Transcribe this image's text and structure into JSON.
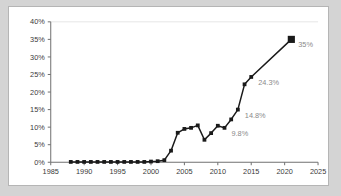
{
  "chart_data": {
    "type": "line",
    "title": "",
    "subtitle": "",
    "xlabel": "",
    "ylabel": "",
    "xlim": [
      1985,
      2025
    ],
    "ylim": [
      0,
      40
    ],
    "grid": false,
    "legend": null,
    "x_ticks": [
      "1985",
      "1990",
      "1995",
      "2000",
      "2005",
      "2010",
      "2015",
      "2020",
      "2025"
    ],
    "x_tick_values": [
      1985,
      1990,
      1995,
      2000,
      2005,
      2010,
      2015,
      2020,
      2025
    ],
    "y_ticks": [
      "0%",
      "5%",
      "10%",
      "15%",
      "20%",
      "25%",
      "30%",
      "35%",
      "40%"
    ],
    "y_tick_values": [
      0,
      5,
      10,
      15,
      20,
      25,
      30,
      35,
      40
    ],
    "series": [
      {
        "name": "",
        "x": [
          1988,
          1989,
          1990,
          1991,
          1992,
          1993,
          1994,
          1995,
          1996,
          1997,
          1998,
          1999,
          2000,
          2001,
          2002,
          2003,
          2004,
          2005,
          2006,
          2007,
          2008,
          2009,
          2010,
          2011,
          2012,
          2013,
          2014,
          2015,
          2021
        ],
        "values": [
          0.1,
          0.1,
          0.1,
          0.1,
          0.1,
          0.1,
          0.1,
          0.1,
          0.1,
          0.1,
          0.1,
          0.1,
          0.2,
          0.3,
          0.6,
          3.3,
          8.4,
          9.5,
          9.8,
          10.5,
          6.4,
          8.3,
          10.4,
          9.8,
          12.2,
          15.0,
          22.2,
          24.3,
          35.0
        ]
      }
    ],
    "annotations": [
      {
        "label": "9.8%",
        "x": 2011,
        "y": 9.8
      },
      {
        "label": "14.8%",
        "x": 2013,
        "y": 15.0
      },
      {
        "label": "24.3%",
        "x": 2015,
        "y": 24.3
      },
      {
        "label": "35%",
        "x": 2021,
        "y": 35.0
      }
    ],
    "colors": {
      "series": "#1a1a1a",
      "axis": "#6e6e6e",
      "tick_text": "#3a3a3a",
      "data_label": "#8a8a8a",
      "plot_background": "#ffffff",
      "page_background": "#d4d4d4",
      "frame_border": "#b5b5b5"
    }
  }
}
